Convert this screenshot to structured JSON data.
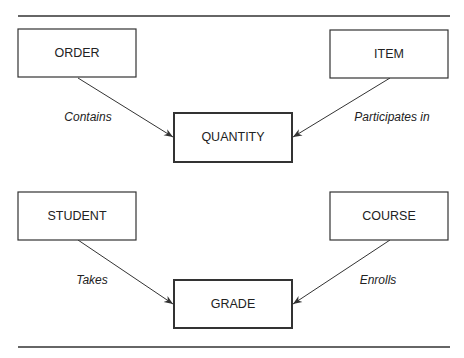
{
  "diagram": {
    "type": "entity-relationship",
    "groups": [
      {
        "entities": {
          "left": "ORDER",
          "right": "ITEM",
          "associative": "QUANTITY"
        },
        "relationships": {
          "left": "Contains",
          "right": "Participates in"
        }
      },
      {
        "entities": {
          "left": "STUDENT",
          "right": "COURSE",
          "associative": "GRADE"
        },
        "relationships": {
          "left": "Takes",
          "right": "Enrolls"
        }
      }
    ],
    "colors": {
      "stroke": "#333333",
      "background": "#ffffff"
    }
  }
}
